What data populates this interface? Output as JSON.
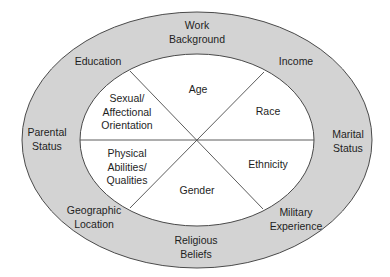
{
  "colors": {
    "outer_ring_fill": "#d3d3d3",
    "inner_fill": "#ffffff",
    "stroke": "#4a4a4a",
    "text": "#1e1e1e"
  },
  "diagram": {
    "outer_ring": {
      "label": "outer-dimensions",
      "items": [
        {
          "id": "work-background",
          "lines": [
            "Work",
            "Background"
          ]
        },
        {
          "id": "income",
          "lines": [
            "Income"
          ]
        },
        {
          "id": "marital-status",
          "lines": [
            "Marital",
            "Status"
          ]
        },
        {
          "id": "military-experience",
          "lines": [
            "Military",
            "Experience"
          ]
        },
        {
          "id": "religious-beliefs",
          "lines": [
            "Religious",
            "Beliefs"
          ]
        },
        {
          "id": "geographic-location",
          "lines": [
            "Geographic",
            "Location"
          ]
        },
        {
          "id": "parental-status",
          "lines": [
            "Parental",
            "Status"
          ]
        },
        {
          "id": "education",
          "lines": [
            "Education"
          ]
        }
      ]
    },
    "inner_core": {
      "label": "core-dimensions",
      "items": [
        {
          "id": "age",
          "lines": [
            "Age"
          ]
        },
        {
          "id": "race",
          "lines": [
            "Race"
          ]
        },
        {
          "id": "ethnicity",
          "lines": [
            "Ethnicity"
          ]
        },
        {
          "id": "gender",
          "lines": [
            "Gender"
          ]
        },
        {
          "id": "physical-abilities",
          "lines": [
            "Physical",
            "Abilities/",
            "Qualities"
          ]
        },
        {
          "id": "sexual-orientation",
          "lines": [
            "Sexual/",
            "Affectional",
            "Orientation"
          ]
        }
      ]
    }
  }
}
